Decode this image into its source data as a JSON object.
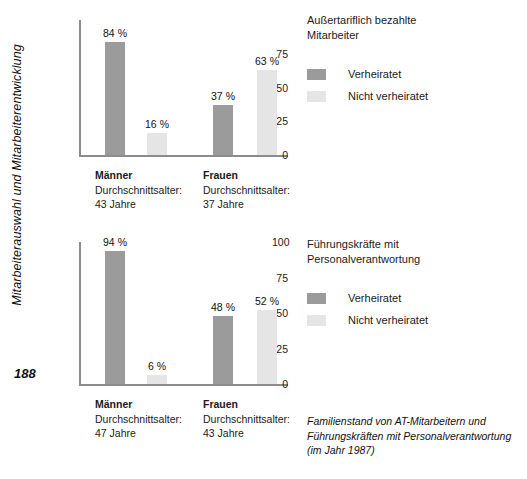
{
  "axis_title": "Mitarbeiterauswahl und Mitarbeiterentwicklung",
  "page_number": "188",
  "figure_caption_lines": [
    "Familienstand von AT-Mitarbeitern und",
    "Führungskräften mit Personalverantwortung",
    "(im Jahr 1987)"
  ],
  "colors": {
    "married": "#9b9b9b",
    "unmarried": "#e5e5e5",
    "axis": "#8c8c8c",
    "text": "#1a1a1a"
  },
  "legend": {
    "married_label": "Verheiratet",
    "unmarried_label": "Nicht verheiratet"
  },
  "charts": [
    {
      "id": "top",
      "side_title_lines": [
        "Außertariflich bezahlte",
        "Mitarbeiter"
      ],
      "groups": [
        {
          "name": "Männer",
          "age_label": "Durchschnittsalter:",
          "age_value": "43 Jahre",
          "married_value": 84,
          "unmarried_value": 16,
          "married_label": "84 %",
          "unmarried_label": "16 %"
        },
        {
          "name": "Frauen",
          "age_label": "Durchschnittsalter:",
          "age_value": "37 Jahre",
          "married_value": 37,
          "unmarried_value": 63,
          "married_label": "37 %",
          "unmarried_label": "63 %"
        }
      ],
      "y_ticks": [
        "75",
        "50",
        "25",
        "0"
      ]
    },
    {
      "id": "bottom",
      "side_title_lines": [
        "Führungskräfte mit",
        "Personalverantwortung"
      ],
      "groups": [
        {
          "name": "Männer",
          "age_label": "Durchschnittsalter:",
          "age_value": "47 Jahre",
          "married_value": 94,
          "unmarried_value": 6,
          "married_label": "94 %",
          "unmarried_label": "6 %"
        },
        {
          "name": "Frauen",
          "age_label": "Durchschnittsalter:",
          "age_value": "43 Jahre",
          "married_value": 48,
          "unmarried_value": 52,
          "married_label": "48 %",
          "unmarried_label": "52 %"
        }
      ],
      "y_ticks": [
        "100",
        "75",
        "50",
        "25",
        "0"
      ]
    }
  ],
  "chart_data": [
    {
      "type": "bar",
      "title": "Außertariflich bezahlte Mitarbeiter",
      "xlabel": "",
      "ylabel": "Mitarbeiterauswahl und Mitarbeiterentwicklung",
      "categories": [
        "Männer",
        "Frauen"
      ],
      "series": [
        {
          "name": "Verheiratet",
          "values": [
            84,
            37
          ],
          "color": "#9b9b9b"
        },
        {
          "name": "Nicht verheiratet",
          "values": [
            16,
            63
          ],
          "color": "#e5e5e5"
        }
      ],
      "data_labels": [
        [
          "84 %",
          "37 %"
        ],
        [
          "16 %",
          "63 %"
        ]
      ],
      "category_annotations": [
        "Durchschnittsalter: 43 Jahre",
        "Durchschnittsalter: 37 Jahre"
      ],
      "ylim": [
        0,
        100
      ],
      "yticks": [
        0,
        25,
        50,
        75
      ],
      "grid": false,
      "legend_position": "right"
    },
    {
      "type": "bar",
      "title": "Führungskräfte mit Personalverantwortung",
      "xlabel": "",
      "ylabel": "Mitarbeiterauswahl und Mitarbeiterentwicklung",
      "categories": [
        "Männer",
        "Frauen"
      ],
      "series": [
        {
          "name": "Verheiratet",
          "values": [
            94,
            48
          ],
          "color": "#9b9b9b"
        },
        {
          "name": "Nicht verheiratet",
          "values": [
            6,
            52
          ],
          "color": "#e5e5e5"
        }
      ],
      "data_labels": [
        [
          "94 %",
          "48 %"
        ],
        [
          "6 %",
          "52 %"
        ]
      ],
      "category_annotations": [
        "Durchschnittsalter: 47 Jahre",
        "Durchschnittsalter: 43 Jahre"
      ],
      "ylim": [
        0,
        100
      ],
      "yticks": [
        0,
        25,
        50,
        75,
        100
      ],
      "grid": false,
      "legend_position": "right"
    }
  ]
}
